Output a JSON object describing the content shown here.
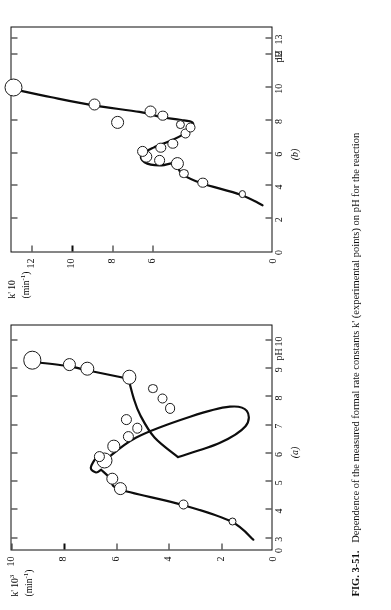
{
  "figure": {
    "label": "FIG. 3-51.",
    "caption": "Dependence of the measured formal rate constants k' (experimental points) on pH for the reaction",
    "caption_plain": "FIG. 3-51.  Dependence of the measured formal rate constants k' (experimental points) on pH for the reaction"
  },
  "panels": {
    "a_tag": "(a)",
    "b_tag": "(b)"
  },
  "axis_titles": {
    "x": "pH",
    "y_a_line1": "k' 10",
    "y_a_exp": "3",
    "y_a_line2": "(min",
    "y_a_exp2": "-1",
    "y_a_line2_end": ")",
    "y_b_line1": "k' 10",
    "y_b_line2": "(min",
    "y_b_exp2": "-1",
    "y_b_line2_end": ")"
  },
  "chart_data": [
    {
      "type": "scatter",
      "panel": "(a)",
      "title": "",
      "xlabel": "pH",
      "ylabel": "k' 10^3 (min^-1)",
      "xlim": [
        2.6,
        10.6
      ],
      "ylim": [
        0,
        10
      ],
      "xticks": [
        0,
        3,
        4,
        5,
        6,
        7,
        8,
        9,
        10
      ],
      "xtick_labels": [
        "0",
        "3",
        "4",
        "5",
        "6",
        "7",
        "8",
        "9",
        "10"
      ],
      "yticks": [
        0,
        2,
        4,
        6,
        8,
        10
      ],
      "ytick_labels": [
        "0",
        "2",
        "4",
        "6",
        "8",
        "10"
      ],
      "grid": false,
      "legend": false,
      "points": [
        {
          "x": 3.6,
          "y": 1.55,
          "r": 4.0
        },
        {
          "x": 4.2,
          "y": 3.45,
          "r": 5.0
        },
        {
          "x": 4.75,
          "y": 5.85,
          "r": 6.6
        },
        {
          "x": 5.1,
          "y": 6.15,
          "r": 6.2
        },
        {
          "x": 5.75,
          "y": 6.45,
          "r": 8.0
        },
        {
          "x": 5.9,
          "y": 6.65,
          "r": 5.6
        },
        {
          "x": 6.25,
          "y": 6.1,
          "r": 6.2
        },
        {
          "x": 6.6,
          "y": 5.55,
          "r": 5.6
        },
        {
          "x": 6.9,
          "y": 5.2,
          "r": 5.2
        },
        {
          "x": 7.2,
          "y": 5.6,
          "r": 5.6
        },
        {
          "x": 7.6,
          "y": 3.95,
          "r": 5.4
        },
        {
          "x": 7.95,
          "y": 4.25,
          "r": 5.0
        },
        {
          "x": 8.3,
          "y": 4.6,
          "r": 4.6
        },
        {
          "x": 8.7,
          "y": 5.5,
          "r": 7.2
        },
        {
          "x": 9.0,
          "y": 7.1,
          "r": 7.2
        },
        {
          "x": 9.15,
          "y": 7.8,
          "r": 6.6
        },
        {
          "x": 9.3,
          "y": 9.2,
          "r": 9.2
        }
      ],
      "curve_description": "Upper branch rises from pH 3 through a sharp left-facing cusp near pH 5.6 then sweeps right to a rounded turning point near pH 7.3 and returns up to pH 9.3"
    },
    {
      "type": "scatter",
      "panel": "(b)",
      "title": "",
      "xlabel": "pH",
      "ylabel": "k' 10 (min^-1)",
      "xlim": [
        0,
        13.8
      ],
      "ylim": [
        0,
        13
      ],
      "xticks": [
        0,
        2,
        4,
        6,
        8,
        10,
        12,
        13
      ],
      "xtick_labels": [
        "0",
        "2",
        "4",
        "6",
        "8",
        "10",
        "12",
        "13"
      ],
      "yticks": [
        0,
        6,
        8,
        10,
        12
      ],
      "ytick_labels": [
        "0",
        "6",
        "8",
        "10",
        "12"
      ],
      "grid": false,
      "legend": false,
      "points": [
        {
          "x": 3.5,
          "y": 1.55,
          "r": 3.6
        },
        {
          "x": 4.2,
          "y": 3.5,
          "r": 5.2
        },
        {
          "x": 4.75,
          "y": 4.45,
          "r": 4.6
        },
        {
          "x": 5.35,
          "y": 4.75,
          "r": 6.6
        },
        {
          "x": 5.55,
          "y": 5.65,
          "r": 5.4
        },
        {
          "x": 5.8,
          "y": 6.3,
          "r": 6.2
        },
        {
          "x": 6.1,
          "y": 6.5,
          "r": 5.4
        },
        {
          "x": 6.35,
          "y": 5.6,
          "r": 5.2
        },
        {
          "x": 6.6,
          "y": 5.0,
          "r": 5.2
        },
        {
          "x": 7.2,
          "y": 4.35,
          "r": 5.0
        },
        {
          "x": 7.6,
          "y": 4.1,
          "r": 5.0
        },
        {
          "x": 7.75,
          "y": 4.6,
          "r": 4.6
        },
        {
          "x": 7.9,
          "y": 7.75,
          "r": 6.4
        },
        {
          "x": 8.3,
          "y": 5.5,
          "r": 5.2
        },
        {
          "x": 8.55,
          "y": 6.1,
          "r": 6.0
        },
        {
          "x": 9.0,
          "y": 8.9,
          "r": 6.0
        },
        {
          "x": 10.0,
          "y": 12.9,
          "r": 9.0
        }
      ],
      "curve_description": "Lower branch rises from pH 3 to a left-facing cusp near pH 5.6, reverses right to a turning point near pH 8.0, then climbs steadily to pH 10"
    }
  ]
}
